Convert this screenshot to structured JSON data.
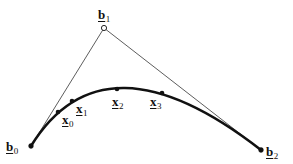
{
  "diagram": {
    "colors": {
      "curve": "#111111",
      "polygon": "#333333",
      "background": "#ffffff"
    },
    "control_points": [
      {
        "id": "b0",
        "base": "b",
        "sub": "0",
        "x": 31,
        "y": 146,
        "marker": "filled"
      },
      {
        "id": "b1",
        "base": "b",
        "sub": "1",
        "x": 104,
        "y": 28,
        "marker": "open"
      },
      {
        "id": "b2",
        "base": "b",
        "sub": "2",
        "x": 261,
        "y": 150,
        "marker": "filled"
      }
    ],
    "curve_points": [
      {
        "id": "x0",
        "base": "x",
        "sub": "0",
        "x": 58,
        "y": 112
      },
      {
        "id": "x1",
        "base": "x",
        "sub": "1",
        "x": 72,
        "y": 101
      },
      {
        "id": "x2",
        "base": "x",
        "sub": "2",
        "x": 117,
        "y": 89
      },
      {
        "id": "x3",
        "base": "x",
        "sub": "3",
        "x": 162,
        "y": 93
      }
    ]
  }
}
